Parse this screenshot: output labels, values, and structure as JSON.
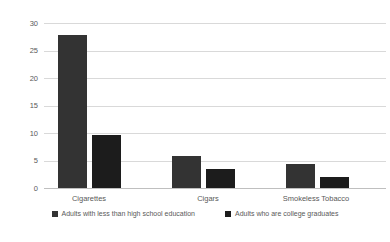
{
  "chart_data": {
    "type": "bar",
    "title": "",
    "xlabel": "",
    "ylabel": "",
    "categories": [
      "Cigarettes",
      "Cigars",
      "Smokeless Tobacco"
    ],
    "series": [
      {
        "name": "Adults with less than high school education",
        "values": [
          27.8,
          5.8,
          4.4
        ],
        "color": "#333333"
      },
      {
        "name": "Adults who are college graduates",
        "values": [
          9.6,
          3.5,
          2.0
        ],
        "color": "#1c1c1c"
      }
    ],
    "ylim": [
      0,
      30
    ],
    "yticks": [
      0,
      5,
      10,
      15,
      20,
      25,
      30
    ],
    "grid": true,
    "legend_position": "bottom",
    "colors": {
      "gridline": "#d9d9d9",
      "axis_line": "#bfbfbf",
      "text": "#595959",
      "background": "#ffffff"
    }
  }
}
